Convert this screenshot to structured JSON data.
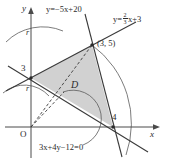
{
  "figure": {
    "type": "coordinate-geometry-diagram",
    "region_label": "D",
    "axes": {
      "x_label": "x",
      "y_label": "y",
      "origin_label": "O"
    },
    "ticks": {
      "y_intercept": "3",
      "x_intercept": "4"
    },
    "points": [
      {
        "name": "vertex-top",
        "label": "(3, 5)",
        "x": 3,
        "y": 5
      },
      {
        "name": "vertex-left",
        "label": "3",
        "x": 0,
        "y": 3
      },
      {
        "name": "vertex-right",
        "label": "4",
        "x": 4,
        "y": 0
      }
    ],
    "lines": [
      {
        "name": "line-steep",
        "equation": "y=−5x+20"
      },
      {
        "name": "line-shallow-prefix",
        "equation_prefix": "y=",
        "numerator": "2",
        "denominator": "3",
        "equation_suffix": "x+3"
      },
      {
        "name": "line-lower",
        "equation": "3x+4y−12=0"
      }
    ],
    "arcs": [
      {
        "name": "arc-outer-upper",
        "radius_label": "r"
      },
      {
        "name": "arc-inner-lower",
        "radius_label": "r"
      },
      {
        "name": "arc-far-right",
        "radius_label": ""
      },
      {
        "name": "arc-small-origin",
        "radius_label": ""
      }
    ],
    "colors": {
      "shade_fill": "#cfcfcf",
      "stroke": "#3a3a3a",
      "text": "#2b2b2b",
      "background": "#ffffff"
    }
  }
}
